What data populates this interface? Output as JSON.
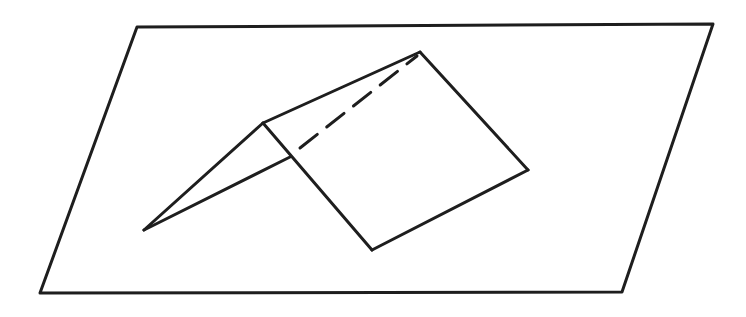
{
  "figure": {
    "colors": {
      "background": "#ffffff",
      "stroke": "#1e1e1e"
    },
    "stroke_width": 3,
    "plane": {
      "points": [
        [
          137,
          27
        ],
        [
          713,
          24
        ],
        [
          622,
          292
        ],
        [
          40,
          293
        ]
      ]
    },
    "fold": {
      "front_apex": [
        263,
        123
      ],
      "back_apex": [
        420,
        52
      ],
      "left_tip": [
        144,
        230
      ],
      "front_base_junction": [
        290,
        157
      ],
      "right_panel_bottom": [
        372,
        250
      ],
      "right_panel_corner": [
        528,
        170
      ]
    },
    "hidden_edge": {
      "from": [
        300,
        148
      ],
      "to": [
        417,
        56
      ],
      "dash": "22 12"
    }
  }
}
